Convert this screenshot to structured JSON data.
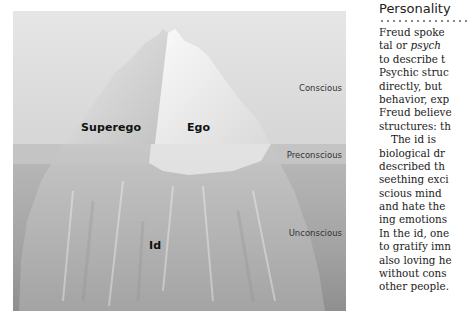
{
  "figure": {
    "labels": {
      "superego": "Superego",
      "ego": "Ego",
      "id": "Id"
    },
    "zones": {
      "conscious": "Conscious",
      "preconscious": "Preconscious",
      "unconscious": "Unconscious"
    }
  },
  "article": {
    "heading": "Personality",
    "lines": [
      {
        "text": "Freud spoke"
      },
      {
        "pre": "tal or ",
        "italic": "psych"
      },
      {
        "text": "to describe t"
      },
      {
        "text": "Psychic struc"
      },
      {
        "text": "directly, but"
      },
      {
        "text": "behavior, exp"
      },
      {
        "text": "Freud believe"
      },
      {
        "text": "structures: th"
      },
      {
        "text": "The id is",
        "indent": true
      },
      {
        "text": "biological dr"
      },
      {
        "text": "described th"
      },
      {
        "text": "seething exci"
      },
      {
        "text": "scious mind"
      },
      {
        "text": "and hate the"
      },
      {
        "text": "ing emotions"
      },
      {
        "text": "In the id, one"
      },
      {
        "text": "to gratify imn"
      },
      {
        "text": "also loving he"
      },
      {
        "text": "without cons"
      },
      {
        "text": "other people."
      }
    ]
  }
}
